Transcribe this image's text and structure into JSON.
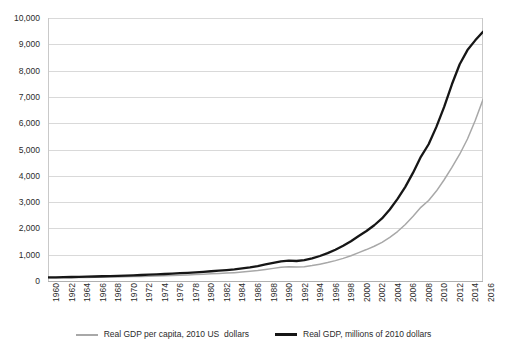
{
  "chart_data": {
    "type": "line",
    "title": "",
    "xlabel": "",
    "ylabel": "",
    "grid": true,
    "legend_position": "bottom",
    "ylim": [
      0,
      10000
    ],
    "ytick_labels": [
      "10,000",
      "9,000",
      "8,000",
      "7,000",
      "6,000",
      "5,000",
      "4,000",
      "3,000",
      "2,000",
      "1,000",
      "0"
    ],
    "yticks": [
      10000,
      9000,
      8000,
      7000,
      6000,
      5000,
      4000,
      3000,
      2000,
      1000,
      0
    ],
    "xtick_labels": [
      "1960",
      "1962",
      "1964",
      "1966",
      "1968",
      "1970",
      "1972",
      "1974",
      "1976",
      "1978",
      "1980",
      "1982",
      "1984",
      "1986",
      "1988",
      "1990",
      "1992",
      "1994",
      "1996",
      "1998",
      "2000",
      "2002",
      "2004",
      "2006",
      "2008",
      "2010",
      "2012",
      "2014",
      "2016"
    ],
    "x": [
      1960,
      1961,
      1962,
      1963,
      1964,
      1965,
      1966,
      1967,
      1968,
      1969,
      1970,
      1971,
      1972,
      1973,
      1974,
      1975,
      1976,
      1977,
      1978,
      1979,
      1980,
      1981,
      1982,
      1983,
      1984,
      1985,
      1986,
      1987,
      1988,
      1989,
      1990,
      1991,
      1992,
      1993,
      1994,
      1995,
      1996,
      1997,
      1998,
      1999,
      2000,
      2001,
      2002,
      2003,
      2004,
      2005,
      2006,
      2007,
      2008,
      2009,
      2010,
      2011,
      2012,
      2013,
      2014,
      2015,
      2016
    ],
    "xlim": [
      1960,
      2016
    ],
    "series": [
      {
        "name": "Real GDP per capita, 2010 US  dollars",
        "color": "#a8a8a8",
        "width": 1.5,
        "values": [
          120,
          122,
          125,
          128,
          132,
          136,
          140,
          145,
          150,
          156,
          162,
          168,
          175,
          183,
          192,
          200,
          210,
          220,
          232,
          245,
          258,
          272,
          286,
          300,
          318,
          340,
          368,
          400,
          440,
          480,
          520,
          545,
          530,
          545,
          585,
          640,
          700,
          775,
          860,
          960,
          1080,
          1195,
          1320,
          1470,
          1660,
          1880,
          2150,
          2460,
          2800,
          3060,
          3420,
          3850,
          4320,
          4820,
          5400,
          6100,
          6900
        ]
      },
      {
        "name": "Real GDP, millions of 2010 dollars",
        "color": "#161616",
        "width": 2.3,
        "values": [
          135,
          140,
          146,
          152,
          158,
          165,
          172,
          180,
          188,
          197,
          207,
          217,
          228,
          240,
          253,
          266,
          280,
          296,
          312,
          330,
          350,
          370,
          392,
          415,
          442,
          478,
          520,
          570,
          630,
          690,
          750,
          775,
          760,
          790,
          860,
          950,
          1060,
          1190,
          1340,
          1510,
          1710,
          1900,
          2120,
          2380,
          2720,
          3120,
          3580,
          4120,
          4720,
          5200,
          5860,
          6620,
          7480,
          8240,
          8780,
          9150,
          9480
        ]
      }
    ]
  },
  "legend": {
    "entries": [
      {
        "label": "Real GDP per capita, 2010 US  dollars",
        "style": "thin"
      },
      {
        "label": "Real GDP, millions of 2010 dollars",
        "style": "thick"
      }
    ]
  }
}
